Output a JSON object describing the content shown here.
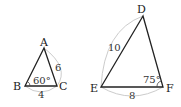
{
  "triangles": [
    {
      "name": "ABC",
      "vertices": [
        {
          "label": "A",
          "x": 44,
          "y": 48
        },
        {
          "label": "B",
          "x": 25,
          "y": 86
        },
        {
          "label": "C",
          "x": 57,
          "y": 86
        }
      ],
      "side_labels": [
        {
          "side": "AC",
          "value": "6"
        },
        {
          "side": "BC",
          "value": "4"
        }
      ],
      "angle_label": {
        "vertex": "B",
        "value": "60°"
      }
    },
    {
      "name": "DEF",
      "vertices": [
        {
          "label": "D",
          "x": 143,
          "y": 16
        },
        {
          "label": "E",
          "x": 101,
          "y": 87
        },
        {
          "label": "F",
          "x": 163,
          "y": 87
        }
      ],
      "side_labels": [
        {
          "side": "DE",
          "value": "10"
        },
        {
          "side": "EF",
          "value": "8"
        }
      ],
      "angle_label": {
        "vertex": "F",
        "value": "75°"
      }
    }
  ],
  "colors": {
    "line": "#222222",
    "arc": "#cccccc"
  }
}
